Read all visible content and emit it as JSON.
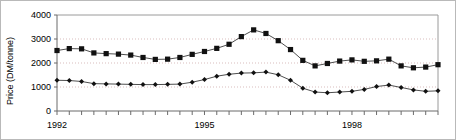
{
  "chart_data": {
    "type": "line",
    "title": "",
    "subtitle": "",
    "xlabel": "",
    "ylabel": "Price (DM/tonne)",
    "ylim": [
      0,
      4000
    ],
    "xlim": [
      1992.0,
      1999.75
    ],
    "grid": true,
    "grid_axis": "y",
    "legend": "none",
    "y_ticks": [
      0,
      1000,
      2000,
      3000,
      4000
    ],
    "y_tick_labels": [
      "0",
      "1000",
      "2000",
      "3000",
      "4000"
    ],
    "x_tick_labels": [
      "1992",
      "1995",
      "1998"
    ],
    "x_tick_values": [
      1992,
      1995,
      1998
    ],
    "x_minor_tick_step": 0.25,
    "x": [
      1992.0,
      1992.25,
      1992.5,
      1992.75,
      1993.0,
      1993.25,
      1993.5,
      1993.75,
      1994.0,
      1994.25,
      1994.5,
      1994.75,
      1995.0,
      1995.25,
      1995.5,
      1995.75,
      1996.0,
      1996.25,
      1996.5,
      1996.75,
      1997.0,
      1997.25,
      1997.5,
      1997.75,
      1998.0,
      1998.25,
      1998.5,
      1998.75,
      1999.0,
      1999.25,
      1999.5,
      1999.75
    ],
    "series": [
      {
        "name": "upper-series",
        "marker": "square",
        "color": "#111111",
        "values": [
          2520,
          2600,
          2590,
          2420,
          2390,
          2370,
          2330,
          2230,
          2150,
          2160,
          2230,
          2360,
          2480,
          2610,
          2780,
          3100,
          3380,
          3230,
          2930,
          2560,
          2110,
          1880,
          1980,
          2080,
          2130,
          2070,
          2090,
          2160,
          1880,
          1800,
          1830,
          1930
        ]
      },
      {
        "name": "lower-series",
        "marker": "diamond",
        "color": "#111111",
        "values": [
          1280,
          1270,
          1230,
          1140,
          1130,
          1120,
          1110,
          1100,
          1100,
          1110,
          1120,
          1200,
          1310,
          1450,
          1530,
          1580,
          1590,
          1620,
          1510,
          1280,
          950,
          790,
          760,
          790,
          820,
          900,
          1020,
          1080,
          980,
          880,
          820,
          840
        ]
      }
    ]
  }
}
